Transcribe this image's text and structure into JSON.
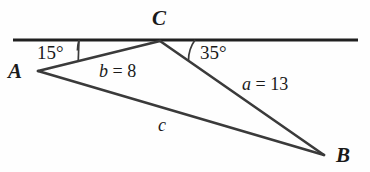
{
  "figure": {
    "type": "triangle-diagram",
    "background_color": "#fefefe",
    "stroke_color": "#3a3a3a",
    "text_color": "#1a1a1a"
  },
  "vertices": {
    "A": {
      "label": "A",
      "x": 38,
      "y": 71
    },
    "B": {
      "label": "B",
      "x": 324,
      "y": 155
    },
    "C": {
      "label": "C",
      "x": 160,
      "y": 41
    }
  },
  "angles": {
    "at_A": {
      "label": "15°",
      "value": 15,
      "unit": "degrees"
    },
    "at_C": {
      "label": "35°",
      "value": 35,
      "unit": "degrees"
    }
  },
  "sides": {
    "b": {
      "label": "b = 8",
      "name": "b",
      "value": 8,
      "between": "A-C"
    },
    "a": {
      "label": "a = 13",
      "name": "a",
      "value": 13,
      "between": "C-B"
    },
    "c": {
      "label": "c",
      "name": "c",
      "value": null,
      "between": "A-B"
    }
  },
  "reference_line": {
    "name": "horizontal-transversal",
    "x_start": 13,
    "x_end": 358,
    "y": 40
  }
}
